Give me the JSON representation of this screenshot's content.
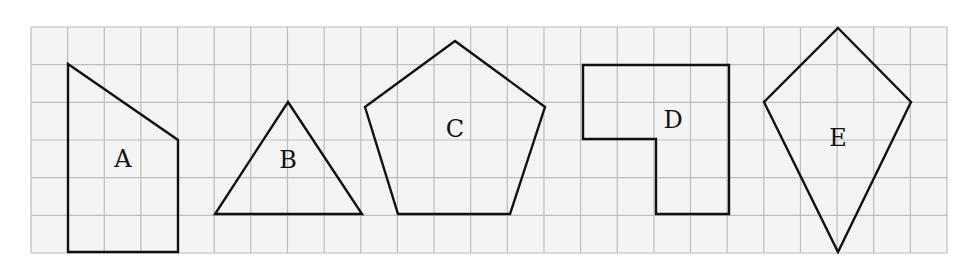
{
  "figure": {
    "grid": {
      "x0": 31,
      "y0": 27,
      "cols": 25,
      "rows": 6,
      "cell_w": 36.64,
      "cell_h": 37.67,
      "background": "#f4f4f4",
      "line_color": "#bdbdbd"
    },
    "shapes": [
      {
        "id": "A",
        "label": "A",
        "type": "quadrilateral",
        "points": "68,64 178,140 178,252 68,252",
        "label_pos": [
          123,
          160
        ]
      },
      {
        "id": "B",
        "label": "B",
        "type": "triangle",
        "points": "288,102 362,214 215,214",
        "label_pos": [
          288,
          161
        ]
      },
      {
        "id": "C",
        "label": "C",
        "type": "pentagon",
        "points": "455,41 545,107 510,214 398,214 365,107",
        "label_pos": [
          455,
          130
        ]
      },
      {
        "id": "D",
        "label": "D",
        "type": "l-shape",
        "points": "583,65 729,65 729,214 656,214 656,139 583,139",
        "label_pos": [
          673,
          121
        ]
      },
      {
        "id": "E",
        "label": "E",
        "type": "kite",
        "points": "838,28 911,102 838,252 764,102",
        "label_pos": [
          838,
          139
        ]
      }
    ]
  }
}
